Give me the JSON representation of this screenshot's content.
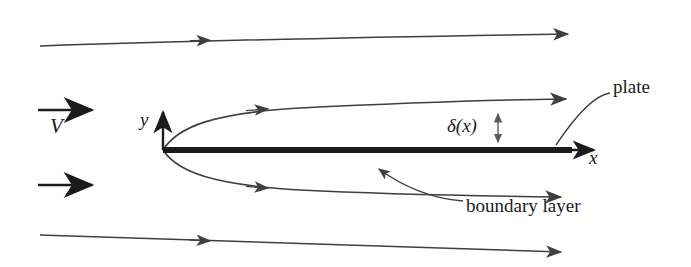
{
  "figure": {
    "background_color": "#ffffff",
    "line_color": "#3f3f3f",
    "plate_color": "#1b1b1b",
    "text_color": "#1b1b1b",
    "width": 691,
    "height": 267
  },
  "labels": {
    "velocity": "V",
    "y_axis": "y",
    "x_axis": "x",
    "boundary_layer_thickness": "δ(x)",
    "plate": "plate",
    "boundary_layer": "boundary layer"
  },
  "diagram_data": {
    "type": "schematic",
    "description": "Uniform free-stream flow V approaching a flat plate; streamlines deflect around the growing boundary layer of thickness delta(x)",
    "origin": {
      "x": 163,
      "y": 150
    },
    "plate": {
      "x_start": 163,
      "x_end": 572,
      "y": 150,
      "thickness": 6
    },
    "axes": {
      "x_axis": {
        "from": [
          163,
          150
        ],
        "to": [
          601,
          150
        ],
        "label": "x",
        "arrow": true
      },
      "y_axis": {
        "from": [
          163,
          150
        ],
        "to": [
          163,
          108
        ],
        "label": "y",
        "arrow": true
      }
    },
    "inlet_arrows": [
      {
        "from": [
          38,
          110
        ],
        "to": [
          99,
          110
        ],
        "label": "V"
      },
      {
        "from": [
          38,
          185
        ],
        "to": [
          99,
          185
        ],
        "label": ""
      }
    ],
    "streamlines": [
      {
        "name": "far-field-upper",
        "points": [
          [
            40,
            46
          ],
          [
            200,
            40
          ],
          [
            400,
            36
          ],
          [
            568,
            34
          ]
        ],
        "arrow_at": 0.36
      },
      {
        "name": "boundary-layer-upper",
        "points": [
          [
            163,
            150
          ],
          [
            200,
            123
          ],
          [
            300,
            110
          ],
          [
            430,
            103
          ],
          [
            568,
            99
          ]
        ],
        "arrow_at": 0.29
      },
      {
        "name": "boundary-layer-lower",
        "points": [
          [
            163,
            150
          ],
          [
            205,
            175
          ],
          [
            300,
            189
          ],
          [
            430,
            194
          ],
          [
            563,
            196
          ]
        ],
        "arrow_at": 0.29
      },
      {
        "name": "far-field-lower",
        "points": [
          [
            40,
            235
          ],
          [
            200,
            241
          ],
          [
            400,
            248
          ],
          [
            563,
            252
          ]
        ],
        "arrow_at": 0.36
      }
    ],
    "dimension": {
      "name": "delta-x",
      "x": 498,
      "y_top": 109,
      "y_bottom": 147,
      "double_headed": true,
      "label": "δ(x)"
    },
    "leaders": [
      {
        "name": "plate-leader",
        "from": [
          609,
          93
        ],
        "to": [
          556,
          146
        ],
        "arrow_at_end": true
      },
      {
        "name": "boundary-layer-leader",
        "from": [
          462,
          200
        ],
        "to": [
          374,
          166
        ],
        "arrow_at_end": true
      }
    ]
  }
}
